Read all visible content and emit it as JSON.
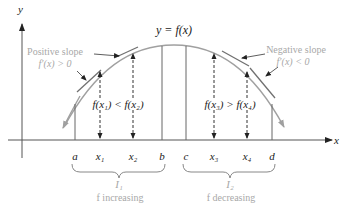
{
  "diagram": {
    "title": "y = f(x)",
    "axes": {
      "x_label": "x",
      "y_label": "y"
    },
    "annotations": {
      "positive_slope": {
        "line1": "Positive slope",
        "line2": "f′(x) > 0"
      },
      "negative_slope": {
        "line1": "Negative slope",
        "line2": "f′(x) < 0"
      },
      "increasing_relation": "f(x₁) < f(x₂)",
      "decreasing_relation": "f(x₃) > f(x₄)"
    },
    "points": {
      "a": "a",
      "x1": "x₁",
      "x2": "x₂",
      "b": "b",
      "c": "c",
      "x3": "x₃",
      "x4": "x₄",
      "d": "d"
    },
    "intervals": [
      {
        "name": "I₁",
        "description": "f increasing"
      },
      {
        "name": "I₂",
        "description": "f decreasing"
      }
    ],
    "colors": {
      "curve": "#a0a0a0",
      "axis": "#555555",
      "text": "#1a1a1a",
      "annotation_text": "#a8a8a8",
      "tangent": "#707070"
    }
  }
}
